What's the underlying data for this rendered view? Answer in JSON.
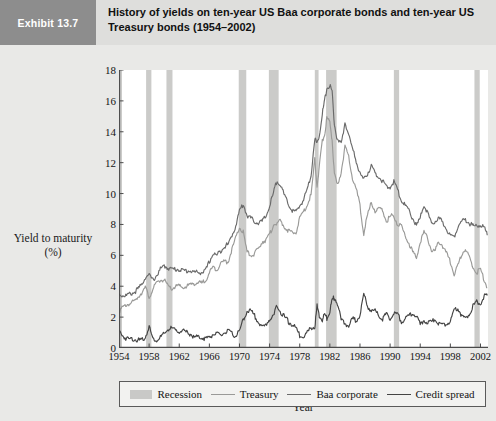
{
  "header": {
    "exhibit_tag": "Exhibit 13.7",
    "title": "History of yields on ten-year US Baa corporate bonds and ten-year US Treasury bonds (1954–2002)"
  },
  "legend": {
    "items": [
      {
        "label": "Recession",
        "marker": "swatch",
        "color": "#c9c9c7"
      },
      {
        "label": "Treasury",
        "marker": "line",
        "color": "#9a9a98"
      },
      {
        "label": "Baa corporate",
        "marker": "line",
        "color": "#6a6a6a"
      },
      {
        "label": "Credit spread",
        "marker": "line",
        "color": "#444444"
      }
    ]
  },
  "chart_data": {
    "type": "line",
    "title": "History of yields on ten-year US Baa corporate bonds and ten-year US Treasury bonds (1954–2002)",
    "xlabel": "Year",
    "ylabel": "Yield to maturity (%)",
    "ylabel_line1": "Yield to maturity",
    "ylabel_line2": "(%)",
    "xlim": [
      1954,
      2003
    ],
    "ylim": [
      0,
      18
    ],
    "ytick_step": 2,
    "yticks": [
      0,
      2,
      4,
      6,
      8,
      10,
      12,
      14,
      16,
      18
    ],
    "xticks": [
      1954,
      1958,
      1962,
      1966,
      1970,
      1974,
      1978,
      1982,
      1986,
      1990,
      1994,
      1998,
      2002
    ],
    "grid": false,
    "legend_position": "below",
    "recession_bands": [
      {
        "start": 1953.6,
        "end": 1954.4
      },
      {
        "start": 1957.6,
        "end": 1958.3
      },
      {
        "start": 1960.3,
        "end": 1961.1
      },
      {
        "start": 1969.9,
        "end": 1970.9
      },
      {
        "start": 1973.9,
        "end": 1975.2
      },
      {
        "start": 1980.0,
        "end": 1980.5
      },
      {
        "start": 1981.5,
        "end": 1982.9
      },
      {
        "start": 1990.5,
        "end": 1991.2
      },
      {
        "start": 2001.2,
        "end": 2001.9
      }
    ],
    "x": [
      1954.0,
      1954.5,
      1955.0,
      1955.5,
      1956.0,
      1956.5,
      1957.0,
      1957.5,
      1958.0,
      1958.5,
      1959.0,
      1959.5,
      1960.0,
      1960.5,
      1961.0,
      1961.5,
      1962.0,
      1962.5,
      1963.0,
      1963.5,
      1964.0,
      1964.5,
      1965.0,
      1965.5,
      1966.0,
      1966.5,
      1967.0,
      1967.5,
      1968.0,
      1968.5,
      1969.0,
      1969.5,
      1970.0,
      1970.5,
      1971.0,
      1971.5,
      1972.0,
      1972.5,
      1973.0,
      1973.5,
      1974.0,
      1974.5,
      1975.0,
      1975.5,
      1976.0,
      1976.5,
      1977.0,
      1977.5,
      1978.0,
      1978.5,
      1979.0,
      1979.5,
      1980.0,
      1980.3,
      1980.6,
      1981.0,
      1981.3,
      1981.6,
      1982.0,
      1982.3,
      1982.6,
      1983.0,
      1983.5,
      1984.0,
      1984.5,
      1985.0,
      1985.5,
      1986.0,
      1986.5,
      1987.0,
      1987.5,
      1988.0,
      1988.5,
      1989.0,
      1989.5,
      1990.0,
      1990.5,
      1991.0,
      1991.5,
      1992.0,
      1992.5,
      1993.0,
      1993.5,
      1994.0,
      1994.5,
      1995.0,
      1995.5,
      1996.0,
      1996.5,
      1997.0,
      1997.5,
      1998.0,
      1998.5,
      1999.0,
      1999.5,
      2000.0,
      2000.5,
      2001.0,
      2001.5,
      2002.0,
      2002.5,
      2002.9
    ],
    "series": [
      {
        "name": "Baa corporate",
        "color": "#6a6a6a",
        "values": [
          3.5,
          3.4,
          3.4,
          3.5,
          3.6,
          3.8,
          4.1,
          4.6,
          4.7,
          4.4,
          4.7,
          5.1,
          5.3,
          5.2,
          5.1,
          5.1,
          5.1,
          5.0,
          5.0,
          5.0,
          4.9,
          4.9,
          4.9,
          5.0,
          5.6,
          6.1,
          6.0,
          6.3,
          6.6,
          6.7,
          7.3,
          7.9,
          8.9,
          9.3,
          8.6,
          8.4,
          8.2,
          8.1,
          8.2,
          8.5,
          9.2,
          10.0,
          10.9,
          10.5,
          9.8,
          9.3,
          8.9,
          8.8,
          9.2,
          9.6,
          10.3,
          11.2,
          13.6,
          13.2,
          13.8,
          15.2,
          16.0,
          16.8,
          17.0,
          16.6,
          14.5,
          13.4,
          13.2,
          14.6,
          13.8,
          12.9,
          12.1,
          11.3,
          10.9,
          11.3,
          11.8,
          11.3,
          11.1,
          10.8,
          10.4,
          10.4,
          10.8,
          10.2,
          9.6,
          9.2,
          8.9,
          8.4,
          7.9,
          8.4,
          9.3,
          8.7,
          8.0,
          8.2,
          8.4,
          8.1,
          7.7,
          7.3,
          7.2,
          7.9,
          8.2,
          8.3,
          8.1,
          7.9,
          7.9,
          8.0,
          7.8,
          7.3
        ]
      },
      {
        "name": "Treasury",
        "color": "#9a9a98",
        "values": [
          2.4,
          2.6,
          2.8,
          2.9,
          3.0,
          3.3,
          3.6,
          3.9,
          3.3,
          3.8,
          4.2,
          4.4,
          4.4,
          4.0,
          3.8,
          4.0,
          4.0,
          3.9,
          4.0,
          4.1,
          4.2,
          4.2,
          4.2,
          4.4,
          4.9,
          5.2,
          5.1,
          5.5,
          5.6,
          5.6,
          6.4,
          7.1,
          7.8,
          7.5,
          6.2,
          6.0,
          6.1,
          6.4,
          6.9,
          7.0,
          7.3,
          8.0,
          8.1,
          8.2,
          7.8,
          7.6,
          7.4,
          7.5,
          8.4,
          8.8,
          9.3,
          9.9,
          12.2,
          10.5,
          11.7,
          13.4,
          13.8,
          14.9,
          14.6,
          13.5,
          11.2,
          10.5,
          11.4,
          13.0,
          12.4,
          11.0,
          10.3,
          9.2,
          7.4,
          8.6,
          9.4,
          8.9,
          9.0,
          8.9,
          8.2,
          8.5,
          8.6,
          8.0,
          7.9,
          7.3,
          6.8,
          6.2,
          5.8,
          6.9,
          7.5,
          7.1,
          6.3,
          6.3,
          6.9,
          6.6,
          6.1,
          5.6,
          4.8,
          5.3,
          6.1,
          6.4,
          5.9,
          5.2,
          4.9,
          5.1,
          4.4,
          3.9
        ]
      },
      {
        "name": "Credit spread",
        "color": "#444444",
        "values": [
          1.1,
          0.8,
          0.6,
          0.6,
          0.6,
          0.5,
          0.5,
          0.7,
          1.4,
          0.6,
          0.5,
          0.7,
          0.9,
          1.2,
          1.3,
          1.1,
          1.1,
          1.1,
          1.0,
          0.9,
          0.7,
          0.7,
          0.7,
          0.6,
          0.7,
          0.9,
          0.9,
          0.8,
          1.0,
          1.1,
          0.9,
          0.8,
          1.1,
          1.8,
          2.4,
          2.4,
          2.1,
          1.7,
          1.3,
          1.5,
          1.9,
          2.0,
          2.8,
          2.3,
          2.0,
          1.7,
          1.5,
          1.3,
          0.8,
          0.8,
          1.0,
          1.3,
          1.4,
          2.7,
          2.1,
          1.8,
          2.2,
          1.9,
          2.4,
          3.1,
          3.3,
          2.9,
          1.8,
          1.6,
          1.4,
          1.9,
          1.8,
          2.1,
          3.5,
          2.7,
          2.4,
          2.4,
          2.1,
          1.9,
          2.2,
          1.9,
          2.2,
          2.2,
          1.7,
          1.9,
          2.1,
          2.2,
          2.1,
          1.5,
          1.8,
          1.6,
          1.7,
          1.9,
          1.5,
          1.5,
          1.6,
          1.7,
          2.4,
          2.6,
          2.1,
          1.9,
          2.2,
          2.7,
          3.0,
          2.9,
          3.4,
          3.4
        ]
      }
    ]
  }
}
